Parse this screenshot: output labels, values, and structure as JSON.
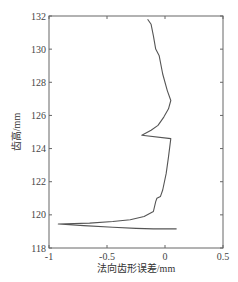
{
  "chart_data": {
    "type": "line",
    "title": "",
    "xlabel": "法向齿形误差/mm",
    "ylabel": "齿高/mm",
    "xlim": [
      -1,
      0.5
    ],
    "ylim": [
      118,
      132
    ],
    "xticks": [
      -1,
      -0.5,
      0,
      0.5
    ],
    "xtick_labels": [
      "-1",
      "-0.5",
      "0",
      "0.5"
    ],
    "yticks": [
      118,
      120,
      122,
      124,
      126,
      128,
      130,
      132
    ],
    "ytick_labels": [
      "118",
      "120",
      "122",
      "124",
      "126",
      "128",
      "130",
      "132"
    ],
    "grid": false,
    "legend": null,
    "series": [
      {
        "name": "profile-error",
        "color": "#555555",
        "points": [
          [
            -0.15,
            131.8
          ],
          [
            -0.12,
            131.5
          ],
          [
            -0.1,
            130.8
          ],
          [
            -0.08,
            130.0
          ],
          [
            -0.05,
            129.6
          ],
          [
            -0.02,
            128.5
          ],
          [
            0.02,
            127.5
          ],
          [
            0.05,
            126.9
          ],
          [
            0.03,
            126.4
          ],
          [
            -0.01,
            125.9
          ],
          [
            -0.06,
            125.4
          ],
          [
            -0.12,
            125.1
          ],
          [
            -0.2,
            124.8
          ],
          [
            0.05,
            124.6
          ],
          [
            0.03,
            123.5
          ],
          [
            0.01,
            122.5
          ],
          [
            -0.02,
            121.5
          ],
          [
            -0.04,
            121.1
          ],
          [
            -0.07,
            121.0
          ],
          [
            -0.08,
            120.8
          ],
          [
            -0.1,
            120.2
          ],
          [
            -0.18,
            119.9
          ],
          [
            -0.3,
            119.7
          ],
          [
            -0.45,
            119.6
          ],
          [
            -0.65,
            119.5
          ],
          [
            -0.92,
            119.45
          ],
          [
            -0.7,
            119.35
          ],
          [
            -0.45,
            119.25
          ],
          [
            -0.25,
            119.18
          ],
          [
            -0.1,
            119.15
          ],
          [
            0.1,
            119.15
          ]
        ]
      }
    ]
  },
  "plot": {
    "left": 49,
    "right": 223,
    "top": 16,
    "bottom": 248
  }
}
